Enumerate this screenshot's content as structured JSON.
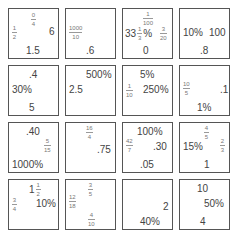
{
  "cards": [
    {
      "items": [
        {
          "type": "frac",
          "num": "0",
          "den": "4",
          "x": 22,
          "y": 3
        },
        {
          "type": "frac",
          "num": "1",
          "den": "2",
          "x": 3,
          "y": 16
        },
        {
          "type": "text",
          "value": "6",
          "x": 40,
          "y": 18
        },
        {
          "type": "text",
          "value": "1.5",
          "x": 17,
          "y": 37
        }
      ]
    },
    {
      "items": [
        {
          "type": "frac",
          "num": "1000",
          "den": "10",
          "x": 3,
          "y": 16
        },
        {
          "type": "text",
          "value": ".6",
          "x": 20,
          "y": 37
        }
      ]
    },
    {
      "items": [
        {
          "type": "frac",
          "num": "1",
          "den": "100",
          "x": 20,
          "y": 2
        },
        {
          "type": "mixed",
          "whole": "33",
          "num": "1",
          "den": "3",
          "suffix": "%",
          "x": 2,
          "y": 17
        },
        {
          "type": "frac",
          "num": "3",
          "den": "20",
          "x": 37,
          "y": 17
        },
        {
          "type": "text",
          "value": "0",
          "x": 20,
          "y": 37
        }
      ]
    },
    {
      "items": [
        {
          "type": "text",
          "value": "10%",
          "x": 3,
          "y": 19
        },
        {
          "type": "text",
          "value": "100",
          "x": 29,
          "y": 19
        },
        {
          "type": "text",
          "value": ".8",
          "x": 20,
          "y": 37
        }
      ]
    },
    {
      "items": [
        {
          "type": "text",
          "value": ".4",
          "x": 20,
          "y": 4
        },
        {
          "type": "text",
          "value": "30%",
          "x": 3,
          "y": 19
        },
        {
          "type": "text",
          "value": "5",
          "x": 20,
          "y": 37
        }
      ]
    },
    {
      "items": [
        {
          "type": "text",
          "value": "500%",
          "x": 20,
          "y": 4
        },
        {
          "type": "text",
          "value": "2.5",
          "x": 3,
          "y": 19
        }
      ]
    },
    {
      "items": [
        {
          "type": "text",
          "value": "5%",
          "x": 17,
          "y": 4
        },
        {
          "type": "frac",
          "num": "1",
          "den": "10",
          "x": 3,
          "y": 17
        },
        {
          "type": "text",
          "value": "250%",
          "x": 20,
          "y": 19
        }
      ]
    },
    {
      "items": [
        {
          "type": "frac",
          "num": "10",
          "den": "5",
          "x": 3,
          "y": 15
        },
        {
          "type": "text",
          "value": ".1",
          "x": 40,
          "y": 19
        },
        {
          "type": "text",
          "value": "1%",
          "x": 17,
          "y": 37
        }
      ]
    },
    {
      "items": [
        {
          "type": "text",
          "value": ".40",
          "x": 17,
          "y": 4
        },
        {
          "type": "frac",
          "num": "5",
          "den": "15",
          "x": 35,
          "y": 15
        },
        {
          "type": "text",
          "value": "1000%",
          "x": 3,
          "y": 37
        }
      ]
    },
    {
      "items": [
        {
          "type": "frac",
          "num": "16",
          "den": "4",
          "x": 20,
          "y": 2
        },
        {
          "type": "text",
          "value": ".75",
          "x": 31,
          "y": 22
        }
      ]
    },
    {
      "items": [
        {
          "type": "text",
          "value": "100%",
          "x": 14,
          "y": 4
        },
        {
          "type": "frac",
          "num": "42",
          "den": "7",
          "x": 3,
          "y": 15
        },
        {
          "type": "text",
          "value": ".30",
          "x": 30,
          "y": 19
        },
        {
          "type": "text",
          "value": ".05",
          "x": 17,
          "y": 37
        }
      ]
    },
    {
      "items": [
        {
          "type": "frac",
          "num": "4",
          "den": "5",
          "x": 24,
          "y": 2
        },
        {
          "type": "text",
          "value": "15%",
          "x": 3,
          "y": 19
        },
        {
          "type": "frac",
          "num": "2",
          "den": "3",
          "x": 40,
          "y": 15
        },
        {
          "type": "text",
          "value": "1",
          "x": 24,
          "y": 37
        }
      ]
    },
    {
      "items": [
        {
          "type": "mixed",
          "whole": "1",
          "num": "1",
          "den": "2",
          "suffix": "",
          "x": 20,
          "y": 2
        },
        {
          "type": "frac",
          "num": "3",
          "den": "4",
          "x": 3,
          "y": 17
        },
        {
          "type": "text",
          "value": "10%",
          "x": 27,
          "y": 19
        }
      ]
    },
    {
      "items": [
        {
          "type": "frac",
          "num": "3",
          "den": "5",
          "x": 22,
          "y": 2
        },
        {
          "type": "frac",
          "num": "12",
          "den": "18",
          "x": 3,
          "y": 14
        },
        {
          "type": "frac",
          "num": "4",
          "den": "10",
          "x": 22,
          "y": 32
        }
      ]
    },
    {
      "items": [
        {
          "type": "text",
          "value": "2",
          "x": 40,
          "y": 22
        },
        {
          "type": "text",
          "value": "40%",
          "x": 17,
          "y": 37
        }
      ]
    },
    {
      "items": [
        {
          "type": "text",
          "value": "10",
          "x": 17,
          "y": 4
        },
        {
          "type": "text",
          "value": "50%",
          "x": 24,
          "y": 19
        },
        {
          "type": "text",
          "value": "4",
          "x": 20,
          "y": 37
        }
      ]
    }
  ],
  "layout": {
    "cols": 4,
    "origin_x": 8,
    "origin_y": 8,
    "step_x": 57,
    "step_y": 57
  }
}
